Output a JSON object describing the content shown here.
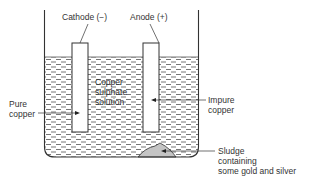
{
  "diagram": {
    "labels": {
      "cathode": "Cathode (−)",
      "anode": "Anode (+)",
      "solution_line1": "Copper",
      "solution_line2": "sulphate",
      "solution_line3": "solution",
      "pure_line1": "Pure",
      "pure_line2": "copper",
      "impure_line1": "Impure",
      "impure_line2": "copper",
      "sludge_line1": "Sludge",
      "sludge_line2": "containing",
      "sludge_line3": "some gold and silver"
    },
    "colors": {
      "line": "#333333",
      "liquid_dash": "#666666",
      "sludge": "#bbbbbb"
    }
  }
}
